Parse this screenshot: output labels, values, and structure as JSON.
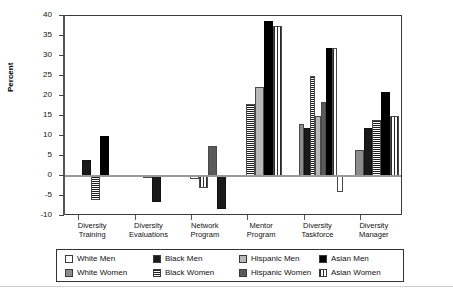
{
  "chart_data": {
    "type": "bar",
    "title": "",
    "xlabel": "",
    "ylabel": "Percent",
    "ylim": [
      -10,
      40
    ],
    "ytick_values": [
      -10,
      -5,
      0,
      5,
      10,
      15,
      20,
      25,
      30,
      35,
      40
    ],
    "ytick_labels": [
      "-10",
      "-5",
      "0",
      "5",
      "10",
      "15",
      "20",
      "25",
      "30",
      "35",
      "40"
    ],
    "grid": false,
    "legend_position": "bottom",
    "categories": [
      "Diversity\nTraining",
      "Diversity\nEvaluations",
      "Network\nProgram",
      "Mentor\nProgram",
      "Diversity\nTaskforce",
      "Diversity\nManager"
    ],
    "series": [
      {
        "name": "White Men",
        "pattern": "solid-white",
        "color": "#ffffff",
        "values": [
          null,
          null,
          -0.7,
          null,
          null,
          null
        ]
      },
      {
        "name": "White Women",
        "pattern": "solid-gray",
        "color": "#8c8c8c",
        "values": [
          null,
          null,
          null,
          null,
          13.0,
          6.5
        ]
      },
      {
        "name": "Black Men",
        "pattern": "solid-black",
        "color": "#1a1a1a",
        "values": [
          4.0,
          -6.5,
          -8.2,
          null,
          12.0,
          12.0
        ]
      },
      {
        "name": "Black Women",
        "pattern": "horizontal-stripes",
        "color": "#1f1f1f",
        "values": [
          -6.0,
          null,
          null,
          18.0,
          25.0,
          14.0
        ]
      },
      {
        "name": "Hispanic Men",
        "pattern": "solid-light-gray",
        "color": "#b8b8b8",
        "values": [
          null,
          -0.3,
          null,
          22.3,
          15.0,
          null
        ]
      },
      {
        "name": "Hispanic Women",
        "pattern": "solid-dark-gray",
        "color": "#5a5a5a",
        "values": [
          null,
          null,
          7.5,
          null,
          18.5,
          null
        ]
      },
      {
        "name": "Asian Men",
        "pattern": "solid-black",
        "color": "#000000",
        "values": [
          10.0,
          null,
          null,
          38.8,
          32.0,
          21.0
        ]
      },
      {
        "name": "Asian Women",
        "pattern": "vertical-stripes",
        "color": "#2a2a2a",
        "values": [
          null,
          null,
          -3.0,
          37.5,
          32.0,
          15.0
        ]
      }
    ],
    "bar_layout": [
      {
        "group": "Diversity Training",
        "bars": [
          {
            "series": "Black Men",
            "value": 4.0
          },
          {
            "series": "Black Women",
            "value": -6.0
          },
          {
            "series": "Asian Men",
            "value": 10.0
          }
        ]
      },
      {
        "group": "Diversity Evaluations",
        "bars": [
          {
            "series": "Hispanic Men",
            "value": -0.3
          },
          {
            "series": "Black Men",
            "value": -6.5
          }
        ]
      },
      {
        "group": "Network Program",
        "bars": [
          {
            "series": "White Men",
            "value": -0.7
          },
          {
            "series": "Asian Women",
            "value": -3.0
          },
          {
            "series": "Hispanic Women",
            "value": 7.5
          },
          {
            "series": "Black Men",
            "value": -8.2
          }
        ]
      },
      {
        "group": "Mentor Program",
        "bars": [
          {
            "series": "Black Women",
            "value": 18.0
          },
          {
            "series": "Hispanic Men",
            "value": 22.3
          },
          {
            "series": "Asian Men",
            "value": 38.8
          },
          {
            "series": "Asian Women",
            "value": 37.5
          }
        ]
      },
      {
        "group": "Diversity Taskforce",
        "bars": [
          {
            "series": "White Women",
            "value": 13.0
          },
          {
            "series": "Black Men",
            "value": 12.0
          },
          {
            "series": "Black Women",
            "value": 25.0
          },
          {
            "series": "Hispanic Men",
            "value": 15.0
          },
          {
            "series": "Hispanic Women",
            "value": 18.5
          },
          {
            "series": "Asian Men",
            "value": 32.0
          },
          {
            "series": "Asian Women",
            "value": 32.0
          },
          {
            "series": "White Men",
            "value": -4.0
          }
        ]
      },
      {
        "group": "Diversity Manager",
        "bars": [
          {
            "series": "White Women",
            "value": 6.5
          },
          {
            "series": "Black Men",
            "value": 12.0
          },
          {
            "series": "Black Women",
            "value": 14.0
          },
          {
            "series": "Asian Men",
            "value": 21.0
          },
          {
            "series": "Asian Women",
            "value": 15.0
          }
        ]
      }
    ]
  },
  "legend": {
    "items": [
      {
        "label": "White Men",
        "swatch": "sw-white"
      },
      {
        "label": "White Women",
        "swatch": "sw-wwomen"
      },
      {
        "label": "Black Men",
        "swatch": "sw-bmen"
      },
      {
        "label": "Black Women",
        "swatch": "sw-bwomen"
      },
      {
        "label": "Hispanic Men",
        "swatch": "sw-hmen"
      },
      {
        "label": "Hispanic Women",
        "swatch": "sw-hwomen"
      },
      {
        "label": "Asian Men",
        "swatch": "sw-amen"
      },
      {
        "label": "Asian Women",
        "swatch": "sw-awomen"
      }
    ]
  }
}
